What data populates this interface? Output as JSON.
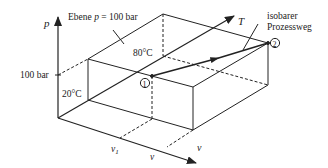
{
  "diagram": {
    "type": "3d p-v-T state space with isobaric process",
    "axes": {
      "p": {
        "label": "p"
      },
      "T": {
        "label": "T"
      },
      "v": {
        "label": "v"
      }
    },
    "plane_label": {
      "prefix": "Ebene ",
      "var": "p",
      "suffix": " = 100 bar"
    },
    "pressure_tick": "100 bar",
    "temperatures": {
      "t1": "20°C",
      "t2": "80°C"
    },
    "volume_ticks": {
      "v1": "v",
      "v1_sub": "1",
      "v": "v"
    },
    "points": {
      "p1": "1",
      "p2": "2"
    },
    "process_label": {
      "line1": "isobarer",
      "line2": "Prozessweg"
    },
    "colors": {
      "line": "#222222",
      "background": "#ffffff"
    }
  }
}
